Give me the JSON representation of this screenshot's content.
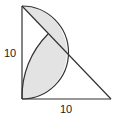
{
  "diagram": {
    "type": "geometry",
    "shape": "right isosceles triangle with semicircle and arc",
    "labels": {
      "left_side": "10",
      "bottom_side": "10"
    },
    "colors": {
      "stroke": "#333333",
      "shade": "#e3e3e3",
      "background": "#ffffff"
    }
  }
}
